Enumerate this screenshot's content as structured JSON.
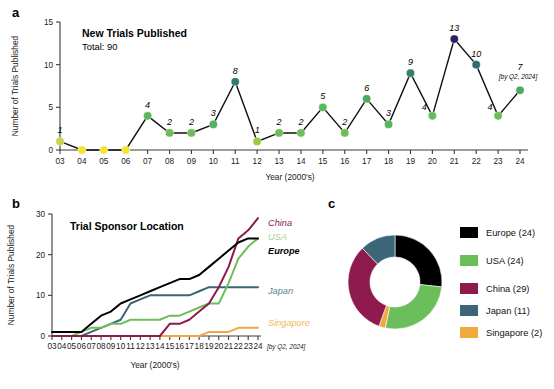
{
  "figure": {
    "panel_a_letter": "a",
    "panel_b_letter": "b",
    "panel_c_letter": "c"
  },
  "panel_a": {
    "title": "New Trials Published",
    "subtitle": "Total: 90",
    "note": "[by Q2, 2024]",
    "chart_data": {
      "type": "line",
      "title": "New Trials Published",
      "xlabel": "Year (2000's)",
      "ylabel": "Number of Trials Published",
      "xlim": [
        2003,
        2024
      ],
      "ylim": [
        0,
        15
      ],
      "yticks": [
        0,
        5,
        10,
        15
      ],
      "grid": false,
      "legend": "none",
      "categories": [
        "03",
        "04",
        "05",
        "06",
        "07",
        "08",
        "09",
        "10",
        "11",
        "12",
        "13",
        "14",
        "15",
        "16",
        "17",
        "18",
        "19",
        "20",
        "21",
        "22",
        "23",
        "24"
      ],
      "values": [
        1,
        0,
        0,
        0,
        4,
        2,
        2,
        3,
        8,
        1,
        2,
        2,
        5,
        2,
        6,
        3,
        9,
        4,
        13,
        10,
        4,
        7
      ],
      "point_colors": [
        "#c8d44a",
        "#f7e334",
        "#f7e334",
        "#f7e334",
        "#5cb85c",
        "#6cbe5a",
        "#6cbe5a",
        "#56b264",
        "#2f7b6f",
        "#9bc93f",
        "#6cbe5a",
        "#6cbe5a",
        "#5cb85c",
        "#6cbe5a",
        "#4aa85f",
        "#58b45f",
        "#35806c",
        "#62bb5b",
        "#2e2060",
        "#2b6f6b",
        "#6cbe5a",
        "#4aa85f"
      ],
      "annotations": [
        "1",
        "",
        "",
        "",
        "4",
        "2",
        "2",
        "3",
        "8",
        "1",
        "2",
        "2",
        "5",
        "2",
        "6",
        "3",
        "9",
        "4",
        "13",
        "10",
        "4",
        "7"
      ]
    }
  },
  "panel_b": {
    "title": "Trial Sponsor Location",
    "note": "[by Q2, 2024]",
    "chart_data": {
      "type": "line",
      "title": "Trial Sponsor Location",
      "xlabel": "Year (2000's)",
      "ylabel": "Number of Trials Published",
      "xlim": [
        2003,
        2024
      ],
      "ylim": [
        0,
        30
      ],
      "yticks": [
        0,
        10,
        20,
        30
      ],
      "grid": false,
      "legend": "inline-right",
      "categories": [
        "03",
        "04",
        "05",
        "06",
        "07",
        "08",
        "09",
        "10",
        "11",
        "12",
        "13",
        "14",
        "15",
        "16",
        "17",
        "18",
        "19",
        "20",
        "21",
        "22",
        "23",
        "24"
      ],
      "series": [
        {
          "name": "China",
          "color": "#8e1a4e",
          "label_color": "#8e1a4e",
          "values": [
            0,
            0,
            0,
            0,
            0,
            0,
            0,
            0,
            0,
            0,
            0,
            0,
            3,
            3,
            4,
            6,
            8,
            12,
            17,
            24,
            26,
            29
          ]
        },
        {
          "name": "USA",
          "color": "#6cbe5a",
          "label_color": "#a9cf8e",
          "values": [
            0,
            0,
            0,
            1,
            2,
            2,
            3,
            3,
            4,
            4,
            4,
            4,
            5,
            5,
            6,
            7,
            8,
            8,
            13,
            19,
            22,
            24
          ]
        },
        {
          "name": "Europe",
          "color": "#000000",
          "label_color": "#000000",
          "values": [
            1,
            1,
            1,
            1,
            3,
            5,
            6,
            8,
            9,
            10,
            11,
            12,
            13,
            14,
            14,
            15,
            17,
            19,
            21,
            23,
            24,
            24
          ]
        },
        {
          "name": "Japan",
          "color": "#3b6678",
          "label_color": "#5c7f90",
          "values": [
            0,
            0,
            0,
            0,
            1,
            2,
            3,
            4,
            8,
            9,
            10,
            10,
            10,
            10,
            10,
            11,
            12,
            12,
            12,
            12,
            12,
            12
          ]
        },
        {
          "name": "Singapore",
          "color": "#f0a93c",
          "label_color": "#f0b957",
          "values": [
            0,
            0,
            0,
            0,
            0,
            0,
            0,
            0,
            0,
            0,
            0,
            0,
            0,
            0,
            0,
            0,
            1,
            1,
            1,
            2,
            2,
            2
          ]
        }
      ]
    }
  },
  "panel_c": {
    "chart_data": {
      "type": "pie",
      "donut": true,
      "title": "",
      "legend_position": "right",
      "labels": [
        "Europe (24)",
        "USA (24)",
        "China (29)",
        "Japan (11)",
        "Singapore (2)"
      ],
      "names": [
        "Europe",
        "USA",
        "China",
        "Japan",
        "Singapore"
      ],
      "values": [
        24,
        24,
        29,
        11,
        2
      ],
      "colors": [
        "#000000",
        "#6cbe5a",
        "#8e1a4e",
        "#3b6678",
        "#f0a93c"
      ]
    }
  }
}
